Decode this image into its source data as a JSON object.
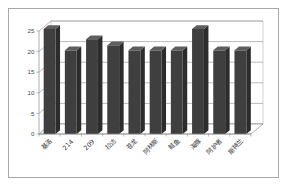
{
  "chart_data": {
    "type": "bar",
    "title": "",
    "subtitle": "",
    "xlabel": "",
    "ylabel": "",
    "categories": [
      "基洛",
      "214",
      "209",
      "拉达",
      "苍龙",
      "阿林斯",
      "鲑鱼",
      "海豚",
      "阿护者",
      "斯特兰"
    ],
    "values": [
      25.5,
      20.3,
      23.0,
      21.5,
      20.3,
      20.3,
      20.3,
      25.5,
      20.3,
      20.3
    ],
    "series": [
      {
        "name": "系列1",
        "values": [
          25.5,
          20.3,
          23.0,
          21.5,
          20.3,
          20.3,
          20.3,
          25.5,
          20.3,
          20.3
        ]
      }
    ],
    "ylim": [
      0,
      25
    ],
    "yticks": [
      0,
      5,
      10,
      15,
      20,
      25
    ],
    "ytick_labels": [
      "0",
      "5",
      "10",
      "15",
      "20",
      "25"
    ],
    "grid": true,
    "grid_axis": "y",
    "legend": false,
    "legend_position": "none",
    "three_d": true,
    "bar_color": "#3f3f3f",
    "bar_top_color": "#5e5e5e",
    "bar_side_color": "#2c2c2c",
    "plot_background": "#ffffff",
    "gridline_color": "#8c8c8c",
    "frame_border_color": "#a8a8a8",
    "tick_label_color": "#4a4a4a",
    "category_label_color": "#3c3c3c",
    "category_label_rotation": -45
  }
}
